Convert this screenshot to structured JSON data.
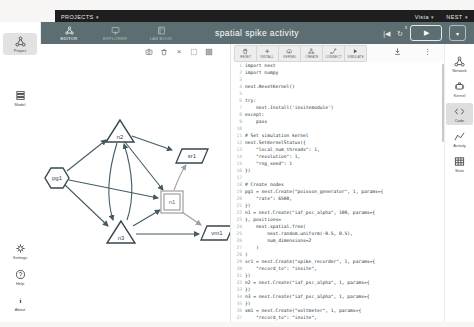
{
  "top_bar": {
    "projects_label": "PROJECTS",
    "right_menus": [
      {
        "label": "Vista"
      },
      {
        "label": "NEST"
      }
    ]
  },
  "toolbar": {
    "title": "spatial spike activity",
    "tabs": [
      {
        "id": "editor",
        "label": "EDITOR",
        "icon": "network",
        "active": true
      },
      {
        "id": "explorer",
        "label": "EXPLORER",
        "icon": "monitor",
        "active": false
      },
      {
        "id": "labbook",
        "label": "LAB BOOK",
        "icon": "book",
        "active": false
      }
    ],
    "history_badge": "3"
  },
  "left_sidebar": {
    "top": [
      {
        "id": "project",
        "label": "Project",
        "icon": "network",
        "selected": true
      },
      {
        "id": "model",
        "label": "Model",
        "icon": "layers",
        "selected": false
      }
    ],
    "bottom": [
      {
        "id": "settings",
        "label": "Settings",
        "icon": "gear"
      },
      {
        "id": "help",
        "label": "Help",
        "icon": "help"
      },
      {
        "id": "about",
        "label": "About",
        "icon": "info"
      }
    ]
  },
  "right_sidebar": {
    "items": [
      {
        "id": "network",
        "label": "Network",
        "icon": "network",
        "selected": false
      },
      {
        "id": "kernel",
        "label": "Kernel",
        "icon": "kernel",
        "selected": false
      },
      {
        "id": "code",
        "label": "Code",
        "icon": "code",
        "selected": true
      },
      {
        "id": "activity",
        "label": "Activity",
        "icon": "activity",
        "selected": false
      },
      {
        "id": "stats",
        "label": "Stats",
        "icon": "stats",
        "selected": false
      }
    ]
  },
  "graph": {
    "toolbar_icons": [
      "camera",
      "trash",
      "close",
      "select",
      "grid"
    ],
    "colors": {
      "edge": "#455a64",
      "recorder_edge": "#9e9e9e",
      "node_stroke": "#37474f",
      "selected_node_stroke": "#9e9e9e"
    },
    "nodes": [
      {
        "id": "pg1",
        "label": "pg1",
        "shape": "hexagon",
        "x": 17,
        "y": 116
      },
      {
        "id": "n2",
        "label": "n2",
        "shape": "triangle",
        "x": 80,
        "y": 71
      },
      {
        "id": "n3",
        "label": "n3",
        "shape": "triangle",
        "x": 81,
        "y": 172
      },
      {
        "id": "n1",
        "label": "n1",
        "shape": "square",
        "x": 132,
        "y": 140
      },
      {
        "id": "sr1",
        "label": "sr1",
        "shape": "parallelogram",
        "x": 152,
        "y": 94
      },
      {
        "id": "vm1",
        "label": "vm1",
        "shape": "parallelogram",
        "x": 177,
        "y": 171
      }
    ],
    "edges": [
      {
        "from": "pg1",
        "to": "n2",
        "kind": "line",
        "x1": 27,
        "y1": 109,
        "x2": 66,
        "y2": 78,
        "color": "edge"
      },
      {
        "from": "pg1",
        "to": "n3",
        "kind": "line",
        "x1": 25,
        "y1": 123,
        "x2": 68,
        "y2": 164,
        "color": "edge"
      },
      {
        "from": "pg1",
        "to": "n1",
        "kind": "line",
        "x1": 29,
        "y1": 118,
        "x2": 118,
        "y2": 136,
        "color": "edge"
      },
      {
        "from": "n2",
        "to": "sr1",
        "kind": "line",
        "x1": 92,
        "y1": 74,
        "x2": 132,
        "y2": 88,
        "color": "edge"
      },
      {
        "from": "n2",
        "to": "n1",
        "kind": "line",
        "x1": 85,
        "y1": 80,
        "x2": 123,
        "y2": 128,
        "color": "edge"
      },
      {
        "from": "n2",
        "to": "n3",
        "kind": "curve",
        "x1": 77,
        "y1": 81,
        "cx": 63,
        "cy": 126,
        "x2": 73,
        "y2": 158,
        "color": "edge"
      },
      {
        "from": "n3",
        "to": "n2",
        "kind": "curve",
        "x1": 87,
        "y1": 158,
        "cx": 98,
        "cy": 126,
        "x2": 84,
        "y2": 82,
        "color": "edge"
      },
      {
        "from": "n3",
        "to": "n1",
        "kind": "line",
        "x1": 93,
        "y1": 164,
        "x2": 120,
        "y2": 148,
        "color": "edge"
      },
      {
        "from": "n3",
        "to": "vm1",
        "kind": "line",
        "x1": 96,
        "y1": 172,
        "x2": 159,
        "y2": 172,
        "color": "edge"
      },
      {
        "from": "n1",
        "to": "sr1",
        "kind": "curve",
        "x1": 134,
        "y1": 128,
        "cx": 141,
        "cy": 110,
        "x2": 146,
        "y2": 103,
        "color": "recorder_edge"
      },
      {
        "from": "n1",
        "to": "vm1",
        "kind": "line",
        "x1": 142,
        "y1": 150,
        "x2": 161,
        "y2": 163,
        "color": "recorder_edge"
      }
    ]
  },
  "code_editor": {
    "blocks": [
      {
        "label": "RESET",
        "icon": "trash"
      },
      {
        "label": "INSTALL",
        "icon": "plus"
      },
      {
        "label": "KERNEL",
        "icon": "cloudup"
      },
      {
        "label": "CREATE",
        "icon": "network"
      },
      {
        "label": "CONNECT",
        "icon": "connect"
      },
      {
        "label": "SIMULATE",
        "icon": "play"
      }
    ],
    "lines": [
      "import nest",
      "import numpy",
      "",
      "nest.ResetKernel()",
      "",
      "try:",
      "    nest.Install('insitemodule')",
      "except:",
      "    pass",
      "",
      "# Set simulation kernel",
      "nest.SetKernelStatus({",
      "    \"local_num_threads\": 1,",
      "    \"resolution\": 1,",
      "    \"rng_seed\": 1",
      "})",
      "",
      "# Create nodes",
      "pg1 = nest.Create(\"poisson_generator\", 1, params={",
      "    \"rate\": 6500,",
      "})",
      "n1 = nest.Create(\"iaf_psc_alpha\", 100, params={",
      "}, positions=",
      "    nest.spatial.free(",
      "        nest.random.uniform(-0.5, 0.5),",
      "        num_dimensions=2",
      "    )",
      ")",
      "sr1 = nest.Create(\"spike_recorder\", 1, params={",
      "    \"record_to\": \"insite\",",
      "})",
      "n2 = nest.Create(\"iaf_psc_alpha\", 1, params={",
      "})",
      "n3 = nest.Create(\"iaf_psc_alpha\", 1, params={",
      "})",
      "vm1 = nest.Create(\"voltmeter\", 1, params={",
      "    \"record_to\": \"insite\","
    ]
  }
}
